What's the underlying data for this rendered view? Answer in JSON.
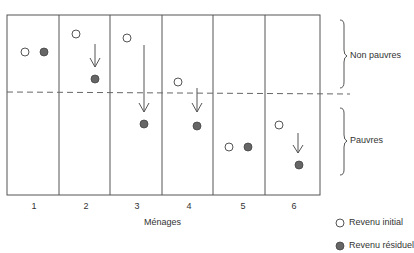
{
  "diagram": {
    "xlabel": "Ménages",
    "households": [
      "1",
      "2",
      "3",
      "4",
      "5",
      "6"
    ],
    "poverty_line": "dashed",
    "groups": {
      "upper": "Non pauvres",
      "lower": "Pauvres"
    },
    "legend": {
      "initial": "Revenu initial",
      "residual": "Revenu résiduel"
    },
    "colors": {
      "initial_fill": "#ffffff",
      "residual_fill": "#666666",
      "line": "#555555"
    },
    "points": [
      {
        "household": "1",
        "initial_y": 52,
        "residual_y": 52,
        "arrow": false
      },
      {
        "household": "2",
        "initial_y": 34,
        "residual_y": 79,
        "arrow": true
      },
      {
        "household": "3",
        "initial_y": 38,
        "residual_y": 124,
        "arrow": true
      },
      {
        "household": "4",
        "initial_y": 82,
        "residual_y": 126,
        "arrow": true
      },
      {
        "household": "5",
        "initial_y": 147,
        "residual_y": 147,
        "arrow": false
      },
      {
        "household": "6",
        "initial_y": 125,
        "residual_y": 165,
        "arrow": true
      }
    ]
  }
}
